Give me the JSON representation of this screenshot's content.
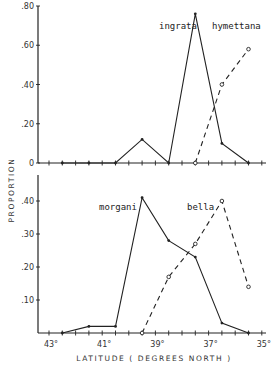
{
  "chart_data": [
    {
      "type": "line",
      "panel": "top",
      "title": "",
      "xlabel": "LATITUDE ( DEGREES NORTH )",
      "ylabel": "PROPORTION",
      "ylim": [
        0,
        0.8
      ],
      "yticks": [
        ".80",
        ".60",
        ".40",
        ".20",
        "0"
      ],
      "x": [
        42.5,
        41.5,
        40.5,
        39.5,
        38.5,
        37.5,
        36.5,
        35.5
      ],
      "series": [
        {
          "name": "ingrata",
          "style": "solid",
          "values": [
            0,
            0,
            0,
            0.12,
            0,
            0.76,
            0.1,
            0
          ]
        },
        {
          "name": "hymettana",
          "style": "dashed",
          "values": [
            null,
            null,
            null,
            null,
            null,
            0,
            0.4,
            0.58
          ]
        }
      ],
      "grid": false,
      "legend": "inline labels near peaks"
    },
    {
      "type": "line",
      "panel": "bottom",
      "title": "",
      "xlabel": "LATITUDE ( DEGREES NORTH )",
      "ylabel": "PROPORTION",
      "ylim": [
        0,
        0.45
      ],
      "yticks": [
        ".40",
        ".30",
        ".20",
        ".10"
      ],
      "xticks": [
        "43°",
        "41°",
        "39°",
        "37°",
        "35°"
      ],
      "x": [
        42.5,
        41.5,
        40.5,
        39.5,
        38.5,
        37.5,
        36.5,
        35.5
      ],
      "series": [
        {
          "name": "morgani",
          "style": "solid",
          "values": [
            0,
            0.02,
            0.02,
            0.41,
            0.28,
            0.23,
            0.03,
            0
          ]
        },
        {
          "name": "bella",
          "style": "dashed",
          "values": [
            null,
            null,
            null,
            0,
            0.17,
            0.27,
            0.4,
            0.14
          ]
        }
      ],
      "grid": false,
      "legend": "inline labels near peaks"
    }
  ],
  "labels": {
    "ylabel": "PROPORTION",
    "xlabel": "LATITUDE ( DEGREES NORTH )",
    "top_yticks": [
      ".80",
      ".60",
      ".40",
      ".20",
      "0"
    ],
    "bottom_yticks": [
      ".40",
      ".30",
      ".20",
      ".10"
    ],
    "xticks": [
      "43°",
      "41°",
      "39°",
      "37°",
      "35°"
    ],
    "ingrata": "ingrata",
    "hymettana": "hymettana",
    "morgani": "morgani",
    "bella": "bella"
  }
}
